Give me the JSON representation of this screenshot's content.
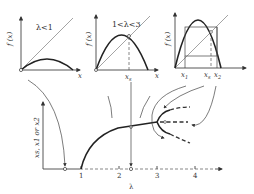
{
  "panels": [
    {
      "id": "p1",
      "condition": "λ<1",
      "ylabel": "f (x)",
      "xlabel": "x"
    },
    {
      "id": "p2",
      "condition": "1<λ<3",
      "ylabel": "f (x)",
      "xlabel": "x",
      "fixed_point_label": "x_s"
    },
    {
      "id": "p3",
      "ylabel": "f (x)",
      "xlabel": "",
      "labels": [
        "x1",
        "xs",
        "x2"
      ]
    }
  ],
  "bifurcation": {
    "ylabel": "xs, x1 or x2",
    "xlabel": "λ",
    "ticks": [
      "1",
      "2",
      "3",
      "4"
    ]
  },
  "text": {
    "p1_cond": "λ<1",
    "p1_y": "f (x)",
    "p1_x": "x",
    "p2_cond": "1<λ<3",
    "p2_y": "f (x)",
    "p2_x": "x",
    "p2_xs": "x",
    "p2_xs_sub": "s",
    "p3_y": "f (x)",
    "p3_x1": "x",
    "p3_x1_sub": "1",
    "p3_xs": "x",
    "p3_xs_sub": "s",
    "p3_x2": "x",
    "p3_x2_sub": "2",
    "b_y": "xs, x1 or x2",
    "b_x": "λ",
    "t1": "1",
    "t2": "2",
    "t3": "3",
    "t4": "4"
  }
}
